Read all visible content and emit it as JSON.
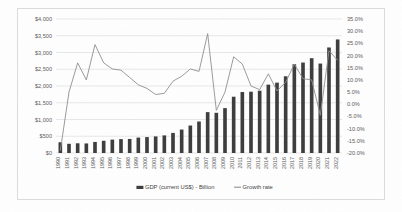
{
  "chart_data": {
    "type": "bar",
    "title": "",
    "subtitle": "",
    "xlabel": "",
    "ylabel": "",
    "grid": true,
    "legend_position": "bottom",
    "categories": [
      "1990",
      "1991",
      "1992",
      "1993",
      "1994",
      "1995",
      "1996",
      "1997",
      "1998",
      "1999",
      "2000",
      "2001",
      "2002",
      "2003",
      "2004",
      "2005",
      "2006",
      "2007",
      "2008",
      "2009",
      "2010",
      "2011",
      "2012",
      "2013",
      "2014",
      "2015",
      "2016",
      "2017",
      "2018",
      "2019",
      "2020",
      "2021",
      "2022"
    ],
    "y_left": {
      "label": "GDP (current US$) - Billion",
      "ylim": [
        0,
        4000
      ],
      "tick_step": 500,
      "tick_labels": [
        "$0",
        "$500",
        "$1,000",
        "$1,500",
        "$2,000",
        "$2,500",
        "$3,000",
        "$3,500",
        "$4,000"
      ],
      "tick_values": [
        0,
        500,
        1000,
        1500,
        2000,
        2500,
        3000,
        3500,
        4000
      ]
    },
    "y_right": {
      "label": "Growth rate",
      "ylim": [
        -20,
        35
      ],
      "tick_step": 5,
      "tick_labels": [
        "-20.0%",
        "-15.0%",
        "-10.0%",
        "-5.0%",
        "0.0%",
        "5.0%",
        "10.0%",
        "15.0%",
        "20.0%",
        "25.0%",
        "30.0%",
        "35.0%"
      ],
      "tick_values": [
        -20,
        -15,
        -10,
        -5,
        0,
        5,
        10,
        15,
        20,
        25,
        30,
        35
      ]
    },
    "series": [
      {
        "name": "GDP (current US$) - Billion",
        "type": "bar",
        "axis": "left",
        "color": "#3b3b3b",
        "values": [
          320,
          275,
          290,
          285,
          330,
          365,
          400,
          415,
          420,
          460,
          475,
          495,
          525,
          600,
          700,
          820,
          940,
          1220,
          1200,
          1340,
          1680,
          1820,
          1830,
          1860,
          2040,
          2100,
          2290,
          2650,
          2700,
          2830,
          2670,
          3150,
          3390
        ]
      },
      {
        "name": "Growth rate",
        "type": "line",
        "axis": "right",
        "color": "#8f8f8f",
        "values": [
          -19.0,
          5.0,
          17.0,
          10.0,
          24.5,
          17.0,
          14.5,
          14.0,
          11.0,
          8.0,
          6.5,
          4.0,
          4.5,
          9.5,
          11.5,
          14.5,
          13.5,
          29.0,
          -2.5,
          5.0,
          19.5,
          16.5,
          7.5,
          6.0,
          12.5,
          5.5,
          9.0,
          16.5,
          10.5,
          10.0,
          -4.5,
          22.0,
          18.0
        ]
      }
    ]
  },
  "legend": {
    "items": [
      {
        "label": "GDP (current US$) - Billion",
        "marker": "bar-swatch"
      },
      {
        "label": "Growth rate",
        "marker": "line-swatch"
      }
    ]
  }
}
